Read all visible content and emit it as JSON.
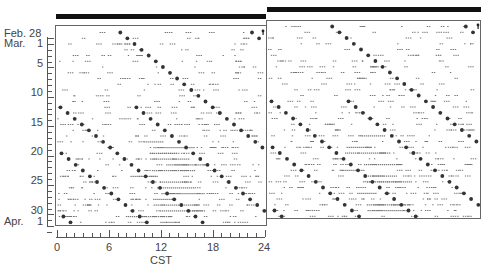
{
  "chart_data": {
    "type": "scatter",
    "subtype": "double-plotted actogram",
    "title": "",
    "xlabel": "CST",
    "ylabel": "",
    "x_ticks": [
      "0",
      "6",
      "12",
      "18",
      "24"
    ],
    "x_range_hours": [
      0,
      24
    ],
    "x_minor_tick_hours": 1,
    "y_tick_labels": [
      {
        "label": "Feb. 28",
        "row": 0
      },
      {
        "label": "Mar.",
        "row": 1,
        "suffix": "1"
      },
      {
        "label": "5",
        "row": 5
      },
      {
        "label": "10",
        "row": 10
      },
      {
        "label": "15",
        "row": 15
      },
      {
        "label": "20",
        "row": 20
      },
      {
        "label": "25",
        "row": 25
      },
      {
        "label": "30",
        "row": 30
      },
      {
        "label": "Apr.",
        "row": 32,
        "suffix": "1"
      }
    ],
    "rows": 34,
    "row_dates": "Feb 28 through Apr 1",
    "light_dark_bar": "solid black bar across top of each 24h panel (constant condition)",
    "panels": [
      {
        "name": "left",
        "hours": [
          0,
          24
        ],
        "row_offset": 0
      },
      {
        "name": "right",
        "hours": [
          24,
          48
        ],
        "row_offset": -1
      }
    ],
    "onset_trails": [
      {
        "start_row": 0,
        "start_hour": 22.5,
        "drift_hours_per_day": 0.82
      },
      {
        "start_row": 0,
        "start_hour": 7.3,
        "drift_hours_per_day": 0.82
      },
      {
        "start_row": 13,
        "start_hour": 0.4,
        "drift_hours_per_day": 0.82
      }
    ],
    "grid": false,
    "legend": null
  },
  "axis": {
    "x_title": "CST",
    "feb_label": "Feb. 28",
    "mar_label": "Mar.",
    "mar_day": "1",
    "apr_label": "Apr.",
    "apr_day": "1",
    "y5": "5",
    "y10": "10",
    "y15": "15",
    "y20": "20",
    "y25": "25",
    "y30": "30",
    "x0": "0",
    "x6": "6",
    "x12": "12",
    "x18": "18",
    "x24": "24"
  },
  "colors": {
    "frame": "#666666",
    "bar": "#111111",
    "dot": "#333333",
    "activity": "#777777"
  }
}
